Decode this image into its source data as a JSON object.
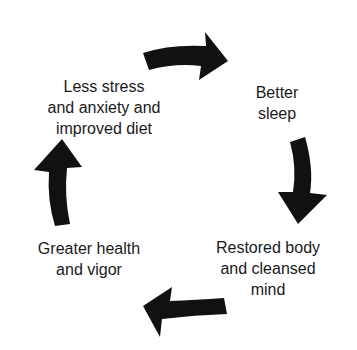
{
  "diagram": {
    "type": "cycle",
    "arrow_color": "#111111",
    "background": "#ffffff",
    "nodes": [
      {
        "id": "stress",
        "lines": [
          "Less stress",
          "and anxiety and",
          "improved diet"
        ]
      },
      {
        "id": "sleep",
        "lines": [
          "Better",
          "sleep"
        ]
      },
      {
        "id": "restored",
        "lines": [
          "Restored body",
          "and cleansed",
          "mind"
        ]
      },
      {
        "id": "health",
        "lines": [
          "Greater health",
          "and vigor"
        ]
      }
    ],
    "edges": [
      {
        "from": "stress",
        "to": "sleep",
        "direction": "clockwise"
      },
      {
        "from": "sleep",
        "to": "restored",
        "direction": "clockwise"
      },
      {
        "from": "restored",
        "to": "health",
        "direction": "clockwise"
      },
      {
        "from": "health",
        "to": "stress",
        "direction": "clockwise"
      }
    ]
  }
}
